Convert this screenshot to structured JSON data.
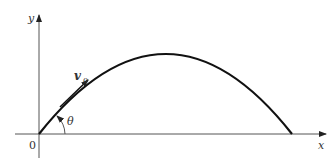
{
  "diagram": {
    "labels": {
      "y_axis": "y",
      "x_axis": "x",
      "origin": "0",
      "velocity": "v",
      "velocity_subscript": "0",
      "angle": "θ"
    },
    "colors": {
      "line": "#111111",
      "axis": "#444444",
      "background": "#ffffff"
    }
  }
}
